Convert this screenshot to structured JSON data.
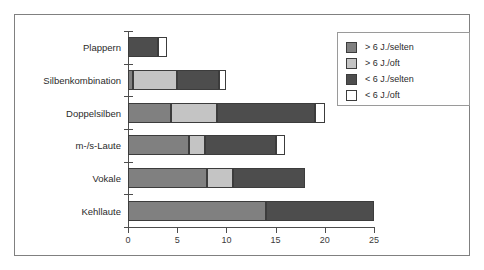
{
  "chart_data": {
    "type": "bar",
    "orientation": "horizontal",
    "stacked": true,
    "title": "",
    "xlabel": "",
    "ylabel": "",
    "xlim": [
      0,
      25
    ],
    "xticks": [
      0,
      5,
      10,
      15,
      20,
      25
    ],
    "xtick_labels": [
      "0",
      "5",
      "10",
      "15",
      "20",
      "25"
    ],
    "grid": false,
    "legend_position": "top-right",
    "categories": [
      "Plappern",
      "Silbenkombination",
      "Doppelsilben",
      "m-/s-Laute",
      "Vokale",
      "Kehllaute"
    ],
    "series": [
      {
        "name": "> 6 J./selten",
        "color": "#808080",
        "values": [
          0,
          0.5,
          4.4,
          6.2,
          8,
          14
        ]
      },
      {
        "name": "> 6 J./oft",
        "color": "#c4c4c4",
        "values": [
          0,
          4.5,
          4.6,
          1.6,
          2.7,
          0
        ]
      },
      {
        "name": "< 6 J./selten",
        "color": "#4d4d4d",
        "values": [
          3,
          4.2,
          10,
          7.2,
          7.3,
          11
        ]
      },
      {
        "name": "< 6 J./oft",
        "color": "#ffffff",
        "values": [
          1,
          0.8,
          1,
          1,
          0,
          0
        ]
      }
    ],
    "totals": [
      4,
      10,
      20,
      16,
      18,
      25
    ]
  },
  "legend": {
    "entries": [
      {
        "label": "> 6 J./selten"
      },
      {
        "label": "> 6 J./oft"
      },
      {
        "label": "< 6 J./selten"
      },
      {
        "label": "< 6 J./oft"
      }
    ]
  }
}
